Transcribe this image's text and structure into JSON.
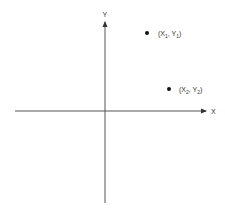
{
  "diagram": {
    "type": "cartesian-coordinate-plane",
    "axes": {
      "x_label": "X",
      "y_label": "Y"
    },
    "points": [
      {
        "name": "X",
        "sub": "1",
        "name2": "Y",
        "sub2": "1",
        "label": "(X1, Y1)",
        "quadrant": "I",
        "position": "upper"
      },
      {
        "name": "X",
        "sub": "2",
        "name2": "Y",
        "sub2": "2",
        "label": "(X2, Y2)",
        "quadrant": "I",
        "position": "lower-right"
      }
    ],
    "colors": {
      "axis": "#555555",
      "point": "#111111",
      "text": "#333333",
      "background": "#ffffff"
    }
  }
}
